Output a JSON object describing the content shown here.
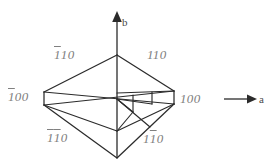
{
  "figure": {
    "kind": "crystal-form-projection",
    "background_color": "#ffffff",
    "line_color": "#2b2b2b",
    "label_color": "#808080",
    "axis_label_color": "#4a4a4a"
  },
  "axes": {
    "vertical": {
      "name": "b-axis",
      "label": "b",
      "direction": "up",
      "arrow": "up-arrow-icon"
    },
    "horizontal": {
      "name": "a-axis",
      "label": "a",
      "direction": "right",
      "arrow": "right-arrow-icon"
    }
  },
  "faces": {
    "top_left": {
      "id": "1bar10",
      "digits": [
        "1",
        "1",
        "0"
      ],
      "overbars": [
        true,
        false,
        false
      ],
      "plain": "-110"
    },
    "top_right": {
      "id": "110",
      "digits": [
        "1",
        "1",
        "0"
      ],
      "overbars": [
        false,
        false,
        false
      ],
      "plain": "110"
    },
    "left": {
      "id": "1bar00",
      "digits": [
        "1",
        "0",
        "0"
      ],
      "overbars": [
        true,
        false,
        false
      ],
      "plain": "-100"
    },
    "right": {
      "id": "100",
      "digits": [
        "1",
        "0",
        "0"
      ],
      "overbars": [
        false,
        false,
        false
      ],
      "plain": "100"
    },
    "bottom_left": {
      "id": "1bar1bar0",
      "digits": [
        "1",
        "1",
        "0"
      ],
      "overbars": [
        true,
        true,
        false
      ],
      "plain": "-1-10"
    },
    "bottom_right": {
      "id": "11bar0",
      "digits": [
        "1",
        "1",
        "0"
      ],
      "overbars": [
        false,
        true,
        false
      ],
      "plain": "1-10"
    }
  },
  "labels": {
    "top_left": "110",
    "top_right": "110",
    "left": "100",
    "right": "100",
    "bottom_left": "110",
    "bottom_right": "110",
    "axis_b": "b",
    "axis_a": "a"
  },
  "geometry": {
    "top_apex": [
      117,
      55
    ],
    "bottom_apex": [
      117,
      158
    ],
    "left_upper": [
      44,
      92
    ],
    "left_lower": [
      44,
      105
    ],
    "right_upper": [
      174,
      91
    ],
    "right_lower": [
      174,
      104
    ],
    "center": [
      117,
      99
    ],
    "inner_left": [
      82,
      100
    ],
    "inner_right": [
      152,
      99
    ],
    "inner_back": [
      117,
      93
    ],
    "inner_front": [
      117,
      131
    ]
  }
}
